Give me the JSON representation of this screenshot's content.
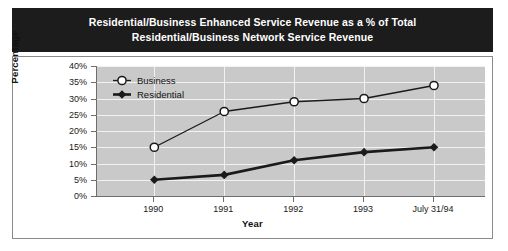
{
  "title": {
    "line1": "Residential/Business Enhanced Service Revenue as a % of Total",
    "line2": "Residential/Business Network Service Revenue"
  },
  "chart_data": {
    "type": "line",
    "title": "Residential/Business Enhanced Service Revenue as a % of Total Residential/Business Network Service Revenue",
    "xlabel": "Year",
    "ylabel": "Percentage",
    "categories": [
      "1990",
      "1991",
      "1992",
      "1993",
      "July 31/94"
    ],
    "ylim": [
      0,
      40
    ],
    "ytick_labels": [
      "0%",
      "5%",
      "10%",
      "15%",
      "20%",
      "25%",
      "30%",
      "35%",
      "40%"
    ],
    "ytick_values": [
      0,
      5,
      10,
      15,
      20,
      25,
      30,
      35,
      40
    ],
    "grid": true,
    "legend_position": "top-left",
    "series": [
      {
        "name": "Business",
        "marker": "open-circle",
        "color": "#1a1a1a",
        "values": [
          15,
          26,
          29,
          30,
          34
        ]
      },
      {
        "name": "Residential",
        "marker": "filled-diamond",
        "color": "#1a1a1a",
        "values": [
          5,
          6.5,
          11,
          13.5,
          15
        ]
      }
    ]
  },
  "colors": {
    "banner_background": "#1c1c1c",
    "banner_text": "#ffffff",
    "plot_background": "#c9c9c9",
    "gridline": "#f2f2f2",
    "axis": "#6e6e6e",
    "series": "#1a1a1a"
  }
}
